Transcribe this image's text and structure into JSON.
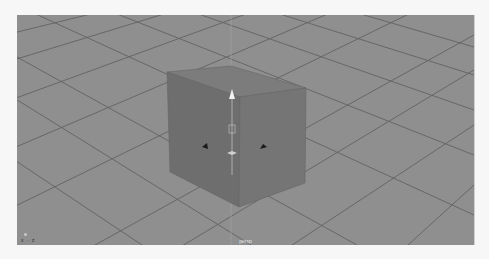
{
  "viewport": {
    "camera_label": "persp",
    "axis_indicator": "x · z",
    "background_color": "#8f8f8f",
    "grid_color": "#5e5e5e",
    "object": {
      "type": "cube",
      "selected": true,
      "top_color": "#7a7a7a",
      "left_color": "#6c6c6c",
      "right_color": "#737373"
    },
    "manipulator": {
      "type": "move-tool",
      "handles": [
        "y-arrow",
        "x-arrow",
        "z-arrow",
        "center-handle"
      ]
    }
  }
}
